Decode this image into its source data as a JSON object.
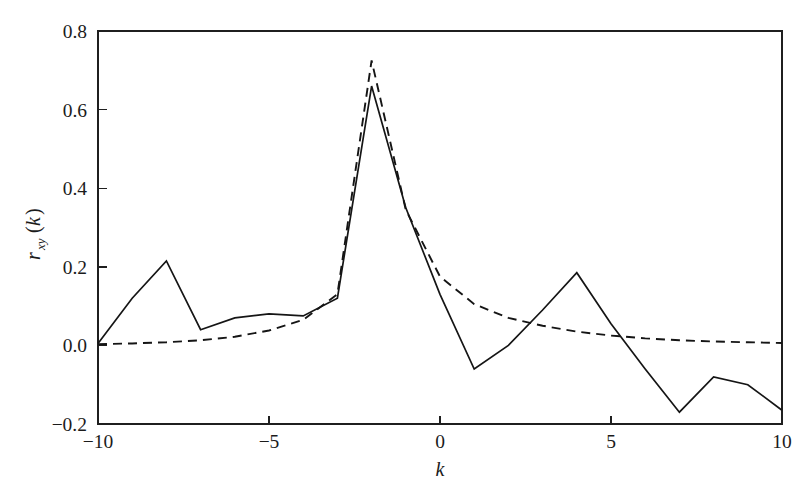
{
  "chart_data": {
    "type": "line",
    "title": "",
    "subtitle": "",
    "xlabel": "k",
    "ylabel": "r_xy(k)",
    "ylabel_parts": {
      "base": "r",
      "subscript": "xy",
      "arg_open": "(",
      "arg": "k",
      "arg_close": ")"
    },
    "xlim": [
      -10,
      10
    ],
    "ylim": [
      -0.2,
      0.8
    ],
    "xticks": [
      -10,
      -5,
      0,
      5,
      10
    ],
    "xtick_labels": [
      "−10",
      "−5",
      "0",
      "5",
      "10"
    ],
    "yticks": [
      -0.2,
      0.0,
      0.2,
      0.4,
      0.6,
      0.8
    ],
    "ytick_labels": [
      "−0.2",
      "0.0",
      "0.2",
      "0.4",
      "0.6",
      "0.8"
    ],
    "grid": false,
    "legend": null,
    "legend_position": "none",
    "frame": "box",
    "x": [
      -10,
      -9,
      -8,
      -7,
      -6,
      -5,
      -4,
      -3,
      -2,
      -1,
      0,
      1,
      2,
      3,
      4,
      5,
      6,
      7,
      8,
      9,
      10
    ],
    "series": [
      {
        "name": "estimated cross-correlation",
        "style": "solid",
        "color": "#151515",
        "values": [
          0.005,
          0.12,
          0.215,
          0.04,
          0.07,
          0.08,
          0.075,
          0.12,
          0.66,
          0.35,
          0.13,
          -0.06,
          0.0,
          0.09,
          0.185,
          0.055,
          -0.06,
          -0.17,
          -0.08,
          -0.1,
          -0.165
        ]
      },
      {
        "name": "theoretical cross-correlation",
        "style": "dashed",
        "color": "#151515",
        "values": [
          0.003,
          0.005,
          0.008,
          0.013,
          0.022,
          0.038,
          0.065,
          0.13,
          0.725,
          0.345,
          0.175,
          0.105,
          0.07,
          0.05,
          0.035,
          0.025,
          0.018,
          0.013,
          0.01,
          0.008,
          0.006
        ]
      }
    ]
  },
  "axes": {
    "x_title": "k",
    "y_title": "r",
    "y_title_sub": "xy",
    "y_title_open": "(",
    "y_title_arg": "k",
    "y_title_close": ")"
  }
}
